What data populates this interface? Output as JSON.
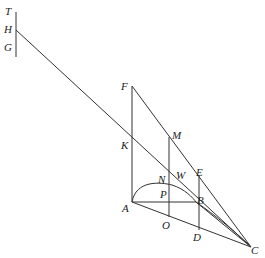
{
  "diagram": {
    "labels": {
      "T": "T",
      "H": "H",
      "G": "G",
      "F": "F",
      "K": "K",
      "M": "M",
      "E": "E",
      "N": "N",
      "W": "W",
      "P": "P",
      "A": "A",
      "B": "B",
      "O": "O",
      "D": "D",
      "C": "C"
    },
    "stroke_color": "#333333"
  }
}
